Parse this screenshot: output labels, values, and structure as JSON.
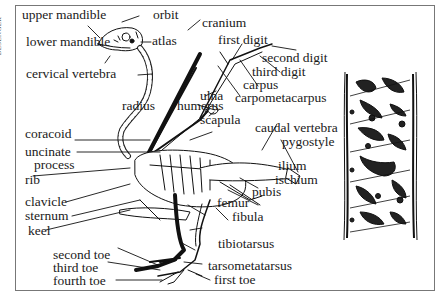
{
  "credit": "BESENGER",
  "diagram": {
    "inset": "Cross-section of hollow bird bone (trabecular structure)",
    "labels": {
      "upper_mandible": "upper mandible",
      "orbit": "orbit",
      "cranium": "cranium",
      "lower_mandible": "lower mandible",
      "atlas": "atlas",
      "cervical_vertebra": "cervical vertebra",
      "first_digit": "first digit",
      "second_digit": "second digit",
      "third_digit": "third digit",
      "carpus": "carpus",
      "ulna": "ulna",
      "carpometacarpus": "carpometacarpus",
      "radius": "radius",
      "humerus": "humerus",
      "scapula": "scapula",
      "coracoid": "coracoid",
      "caudal_vertebra": "caudal vertebra",
      "pygostyle": "pygostyle",
      "uncinate": "uncinate",
      "process": "process",
      "ilium": "ilium",
      "ischium": "ischium",
      "rib": "rib",
      "pubis": "pubis",
      "clavicle": "clavicle",
      "femur": "femur",
      "sternum": "sternum",
      "fibula": "fibula",
      "keel": "keel",
      "tibiotarsus": "tibiotarsus",
      "second_toe": "second toe",
      "third_toe": "third toe",
      "tarsometatarsus": "tarsometatarsus",
      "fourth_toe": "fourth toe",
      "first_toe": "first toe"
    }
  }
}
